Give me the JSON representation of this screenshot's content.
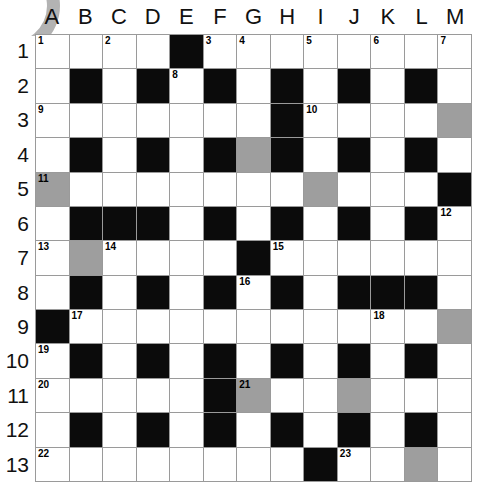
{
  "puzzle": {
    "title": "Crossword Grid",
    "type": "crossword-grid",
    "columns": 13,
    "rows": 13,
    "column_labels": [
      "A",
      "B",
      "C",
      "D",
      "E",
      "F",
      "G",
      "H",
      "I",
      "J",
      "K",
      "L",
      "M"
    ],
    "row_labels": [
      "1",
      "2",
      "3",
      "4",
      "5",
      "6",
      "7",
      "8",
      "9",
      "10",
      "11",
      "12",
      "13"
    ],
    "colors": {
      "white_cell": "#ffffff",
      "black_cell": "#0b0b0b",
      "grey_cell": "#9e9e9e",
      "grid_line": "#9a9a9a",
      "text": "#000000",
      "arc": "#b3b3b3"
    },
    "legend": {
      "white": "open letter cell",
      "black": "blocked cell",
      "grey": "highlighted / shaded cell"
    },
    "clue_numbers": [
      1,
      2,
      3,
      4,
      5,
      6,
      7,
      8,
      9,
      10,
      11,
      12,
      13,
      14,
      15,
      16,
      17,
      18,
      19,
      20,
      21,
      22,
      23
    ],
    "cells": [
      [
        {
          "state": "white",
          "num": "1"
        },
        {
          "state": "white",
          "num": ""
        },
        {
          "state": "white",
          "num": "2"
        },
        {
          "state": "white",
          "num": ""
        },
        {
          "state": "black",
          "num": ""
        },
        {
          "state": "white",
          "num": "3"
        },
        {
          "state": "white",
          "num": "4"
        },
        {
          "state": "white",
          "num": ""
        },
        {
          "state": "white",
          "num": "5"
        },
        {
          "state": "white",
          "num": ""
        },
        {
          "state": "white",
          "num": "6"
        },
        {
          "state": "white",
          "num": ""
        },
        {
          "state": "white",
          "num": "7"
        }
      ],
      [
        {
          "state": "white",
          "num": ""
        },
        {
          "state": "black",
          "num": ""
        },
        {
          "state": "white",
          "num": ""
        },
        {
          "state": "black",
          "num": ""
        },
        {
          "state": "white",
          "num": "8"
        },
        {
          "state": "black",
          "num": ""
        },
        {
          "state": "white",
          "num": ""
        },
        {
          "state": "black",
          "num": ""
        },
        {
          "state": "white",
          "num": ""
        },
        {
          "state": "black",
          "num": ""
        },
        {
          "state": "white",
          "num": ""
        },
        {
          "state": "black",
          "num": ""
        },
        {
          "state": "white",
          "num": ""
        }
      ],
      [
        {
          "state": "white",
          "num": "9"
        },
        {
          "state": "white",
          "num": ""
        },
        {
          "state": "white",
          "num": ""
        },
        {
          "state": "white",
          "num": ""
        },
        {
          "state": "white",
          "num": ""
        },
        {
          "state": "white",
          "num": ""
        },
        {
          "state": "white",
          "num": ""
        },
        {
          "state": "black",
          "num": ""
        },
        {
          "state": "white",
          "num": "10"
        },
        {
          "state": "white",
          "num": ""
        },
        {
          "state": "white",
          "num": ""
        },
        {
          "state": "white",
          "num": ""
        },
        {
          "state": "grey",
          "num": ""
        }
      ],
      [
        {
          "state": "white",
          "num": ""
        },
        {
          "state": "black",
          "num": ""
        },
        {
          "state": "white",
          "num": ""
        },
        {
          "state": "black",
          "num": ""
        },
        {
          "state": "white",
          "num": ""
        },
        {
          "state": "black",
          "num": ""
        },
        {
          "state": "grey",
          "num": ""
        },
        {
          "state": "black",
          "num": ""
        },
        {
          "state": "white",
          "num": ""
        },
        {
          "state": "black",
          "num": ""
        },
        {
          "state": "white",
          "num": ""
        },
        {
          "state": "black",
          "num": ""
        },
        {
          "state": "white",
          "num": ""
        }
      ],
      [
        {
          "state": "grey",
          "num": "11"
        },
        {
          "state": "white",
          "num": ""
        },
        {
          "state": "white",
          "num": ""
        },
        {
          "state": "white",
          "num": ""
        },
        {
          "state": "white",
          "num": ""
        },
        {
          "state": "white",
          "num": ""
        },
        {
          "state": "white",
          "num": ""
        },
        {
          "state": "white",
          "num": ""
        },
        {
          "state": "grey",
          "num": ""
        },
        {
          "state": "white",
          "num": ""
        },
        {
          "state": "white",
          "num": ""
        },
        {
          "state": "white",
          "num": ""
        },
        {
          "state": "black",
          "num": ""
        }
      ],
      [
        {
          "state": "white",
          "num": ""
        },
        {
          "state": "black",
          "num": ""
        },
        {
          "state": "black",
          "num": ""
        },
        {
          "state": "black",
          "num": ""
        },
        {
          "state": "white",
          "num": ""
        },
        {
          "state": "black",
          "num": ""
        },
        {
          "state": "white",
          "num": ""
        },
        {
          "state": "black",
          "num": ""
        },
        {
          "state": "white",
          "num": ""
        },
        {
          "state": "black",
          "num": ""
        },
        {
          "state": "white",
          "num": ""
        },
        {
          "state": "black",
          "num": ""
        },
        {
          "state": "white",
          "num": "12"
        }
      ],
      [
        {
          "state": "white",
          "num": "13"
        },
        {
          "state": "grey",
          "num": ""
        },
        {
          "state": "white",
          "num": "14"
        },
        {
          "state": "white",
          "num": ""
        },
        {
          "state": "white",
          "num": ""
        },
        {
          "state": "white",
          "num": ""
        },
        {
          "state": "black",
          "num": ""
        },
        {
          "state": "white",
          "num": "15"
        },
        {
          "state": "white",
          "num": ""
        },
        {
          "state": "white",
          "num": ""
        },
        {
          "state": "white",
          "num": ""
        },
        {
          "state": "white",
          "num": ""
        },
        {
          "state": "white",
          "num": ""
        }
      ],
      [
        {
          "state": "white",
          "num": ""
        },
        {
          "state": "black",
          "num": ""
        },
        {
          "state": "white",
          "num": ""
        },
        {
          "state": "black",
          "num": ""
        },
        {
          "state": "white",
          "num": ""
        },
        {
          "state": "black",
          "num": ""
        },
        {
          "state": "white",
          "num": "16"
        },
        {
          "state": "black",
          "num": ""
        },
        {
          "state": "white",
          "num": ""
        },
        {
          "state": "black",
          "num": ""
        },
        {
          "state": "black",
          "num": ""
        },
        {
          "state": "black",
          "num": ""
        },
        {
          "state": "white",
          "num": ""
        }
      ],
      [
        {
          "state": "black",
          "num": ""
        },
        {
          "state": "white",
          "num": "17"
        },
        {
          "state": "white",
          "num": ""
        },
        {
          "state": "white",
          "num": ""
        },
        {
          "state": "white",
          "num": ""
        },
        {
          "state": "white",
          "num": ""
        },
        {
          "state": "white",
          "num": ""
        },
        {
          "state": "white",
          "num": ""
        },
        {
          "state": "white",
          "num": ""
        },
        {
          "state": "white",
          "num": ""
        },
        {
          "state": "white",
          "num": "18"
        },
        {
          "state": "white",
          "num": ""
        },
        {
          "state": "grey",
          "num": ""
        }
      ],
      [
        {
          "state": "white",
          "num": "19"
        },
        {
          "state": "black",
          "num": ""
        },
        {
          "state": "white",
          "num": ""
        },
        {
          "state": "black",
          "num": ""
        },
        {
          "state": "white",
          "num": ""
        },
        {
          "state": "black",
          "num": ""
        },
        {
          "state": "white",
          "num": ""
        },
        {
          "state": "black",
          "num": ""
        },
        {
          "state": "white",
          "num": ""
        },
        {
          "state": "black",
          "num": ""
        },
        {
          "state": "white",
          "num": ""
        },
        {
          "state": "black",
          "num": ""
        },
        {
          "state": "white",
          "num": ""
        }
      ],
      [
        {
          "state": "white",
          "num": "20"
        },
        {
          "state": "white",
          "num": ""
        },
        {
          "state": "white",
          "num": ""
        },
        {
          "state": "white",
          "num": ""
        },
        {
          "state": "white",
          "num": ""
        },
        {
          "state": "black",
          "num": ""
        },
        {
          "state": "grey",
          "num": "21"
        },
        {
          "state": "white",
          "num": ""
        },
        {
          "state": "white",
          "num": ""
        },
        {
          "state": "grey",
          "num": ""
        },
        {
          "state": "white",
          "num": ""
        },
        {
          "state": "white",
          "num": ""
        },
        {
          "state": "white",
          "num": ""
        }
      ],
      [
        {
          "state": "white",
          "num": ""
        },
        {
          "state": "black",
          "num": ""
        },
        {
          "state": "white",
          "num": ""
        },
        {
          "state": "black",
          "num": ""
        },
        {
          "state": "white",
          "num": ""
        },
        {
          "state": "black",
          "num": ""
        },
        {
          "state": "white",
          "num": ""
        },
        {
          "state": "black",
          "num": ""
        },
        {
          "state": "white",
          "num": ""
        },
        {
          "state": "black",
          "num": ""
        },
        {
          "state": "white",
          "num": ""
        },
        {
          "state": "black",
          "num": ""
        },
        {
          "state": "white",
          "num": ""
        }
      ],
      [
        {
          "state": "white",
          "num": "22"
        },
        {
          "state": "white",
          "num": ""
        },
        {
          "state": "white",
          "num": ""
        },
        {
          "state": "white",
          "num": ""
        },
        {
          "state": "white",
          "num": ""
        },
        {
          "state": "white",
          "num": ""
        },
        {
          "state": "white",
          "num": ""
        },
        {
          "state": "white",
          "num": ""
        },
        {
          "state": "black",
          "num": ""
        },
        {
          "state": "white",
          "num": "23"
        },
        {
          "state": "white",
          "num": ""
        },
        {
          "state": "grey",
          "num": ""
        },
        {
          "state": "white",
          "num": ""
        }
      ]
    ]
  }
}
